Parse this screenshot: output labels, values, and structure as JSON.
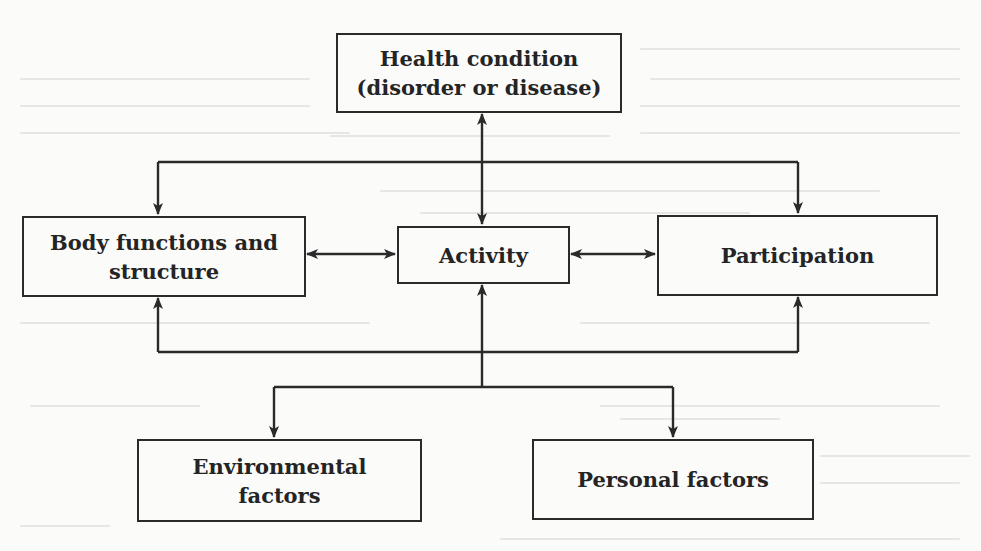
{
  "diagram": {
    "type": "flowchart",
    "nodes": {
      "health_condition": {
        "line1": "Health condition",
        "line2": "(disorder or disease)"
      },
      "body_functions": {
        "line1": "Body functions and",
        "line2": "structure"
      },
      "activity": {
        "label": "Activity"
      },
      "participation": {
        "label": "Participation"
      },
      "environmental_factors": {
        "line1": "Environmental",
        "line2": "factors"
      },
      "personal_factors": {
        "label": "Personal factors"
      }
    },
    "edges": [
      {
        "from": "health_condition",
        "to": "activity",
        "bidirectional": true
      },
      {
        "from": "health_condition",
        "to": "body_functions",
        "bidirectional": false
      },
      {
        "from": "health_condition",
        "to": "participation",
        "bidirectional": false
      },
      {
        "from": "body_functions",
        "to": "activity",
        "bidirectional": true
      },
      {
        "from": "activity",
        "to": "participation",
        "bidirectional": true
      },
      {
        "from": "contextual_bus",
        "to": "body_functions",
        "bidirectional": false
      },
      {
        "from": "contextual_bus",
        "to": "activity",
        "bidirectional": false
      },
      {
        "from": "contextual_bus",
        "to": "participation",
        "bidirectional": false
      },
      {
        "from": "contextual_bus",
        "to": "environmental_factors",
        "bidirectional": false
      },
      {
        "from": "contextual_bus",
        "to": "personal_factors",
        "bidirectional": false
      }
    ],
    "colors": {
      "line": "#2a2a2a",
      "text": "#242424",
      "background": "#fbfbfa",
      "bleed_through_text": "#e6e6e4"
    }
  }
}
